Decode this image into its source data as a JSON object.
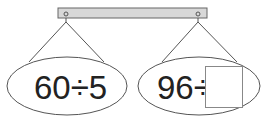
{
  "bar": {
    "fill": "#d8d8d8",
    "stroke": "#666666"
  },
  "left": {
    "expression": "60÷5"
  },
  "right": {
    "expression": "96÷",
    "answer_box": ""
  },
  "colors": {
    "line": "#555555",
    "text": "#222222"
  }
}
